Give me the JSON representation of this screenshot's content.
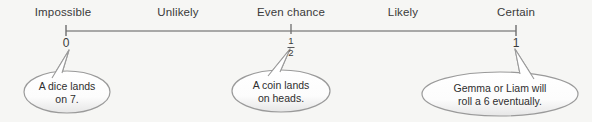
{
  "diagram": {
    "background_color": "#f6f6f4",
    "line_color": "#8a8a8a",
    "text_color": "#3a3a3a",
    "bubble_fill": "#ffffff",
    "bubble_stroke": "#9a9a9a"
  },
  "scale": {
    "labels": [
      {
        "text": "Impossible",
        "x": 63
      },
      {
        "text": "Unlikely",
        "x": 178
      },
      {
        "text": "Even chance",
        "x": 291
      },
      {
        "text": "Likely",
        "x": 403
      },
      {
        "text": "Certain",
        "x": 516
      }
    ],
    "ticks": [
      {
        "value": "0",
        "x": 66
      },
      {
        "value": "1/2",
        "x": 291,
        "numerator": "1",
        "denominator": "2"
      },
      {
        "value": "1",
        "x": 516
      }
    ],
    "line": {
      "x1": 66,
      "x2": 516,
      "y": 31
    }
  },
  "bubbles": [
    {
      "id": "bubble-impossible",
      "lines": [
        "A dice lands",
        "on 7."
      ],
      "cx": 67,
      "cy": 92,
      "rx": 43,
      "ry": 21,
      "tail_direction": "up-right"
    },
    {
      "id": "bubble-even-chance",
      "lines": [
        "A coin lands",
        "on heads."
      ],
      "cx": 281,
      "cy": 91,
      "rx": 49,
      "ry": 21,
      "tail_direction": "up-right"
    },
    {
      "id": "bubble-certain",
      "lines": [
        "Gemma or Liam will",
        "roll a 6 eventually."
      ],
      "cx": 500,
      "cy": 94,
      "rx": 78,
      "ry": 22,
      "tail_direction": "up-left"
    }
  ]
}
